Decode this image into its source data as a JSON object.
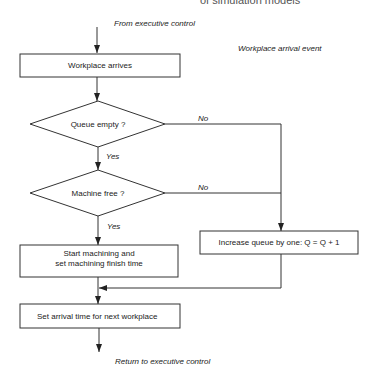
{
  "header": {
    "partial_title": "of simulation models"
  },
  "title": "Workplace arrival event",
  "entry_label": "From executive control",
  "exit_label": "Return to executive control",
  "nodes": {
    "arrive": "Workplace arrives",
    "queue_empty": "Queue empty ?",
    "machine_free": "Machine free ?",
    "start_machining_1": "Start machining and",
    "start_machining_2": "set machining finish time",
    "increase_queue": "Increase queue by one: Q = Q + 1",
    "set_arrival": "Set arrival time for next workplace"
  },
  "edge_labels": {
    "queue_no": "No",
    "queue_yes": "Yes",
    "machine_no": "No",
    "machine_yes": "Yes"
  }
}
